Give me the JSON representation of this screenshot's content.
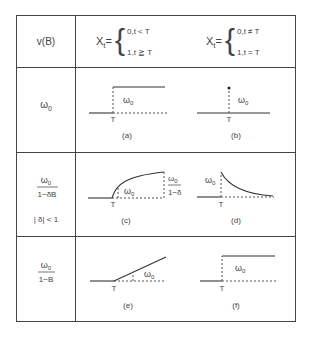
{
  "header": {
    "col0": "v(B)",
    "col1": {
      "lhs": "X",
      "sub": "t",
      "eq": "=",
      "case1": "0,t < T",
      "case2": "1,t ≧ T"
    },
    "col2": {
      "lhs": "X",
      "sub": "t",
      "eq": "=",
      "case1": "0,t ≠ T",
      "case2": "1,t = T"
    }
  },
  "rows": [
    {
      "label": {
        "num": "ω",
        "num_sub": "0"
      },
      "graphs": [
        {
          "id": "a",
          "caption": "(a)",
          "t_label": "T",
          "omega": "ω",
          "omega_sub": "0"
        },
        {
          "id": "b",
          "caption": "(b)",
          "t_label": "T",
          "omega": "ω",
          "omega_sub": "0"
        }
      ]
    },
    {
      "label": {
        "num": "ω",
        "num_sub": "0",
        "den": "1−δB",
        "cond": "| δ| < 1"
      },
      "graphs": [
        {
          "id": "c",
          "caption": "(c)",
          "t_label": "T",
          "omega": "ω",
          "omega_sub": "0",
          "limit_num": "ω",
          "limit_sub": "0",
          "limit_den": "1−δ"
        },
        {
          "id": "d",
          "caption": "(d)",
          "t_label": "T",
          "omega": "ω",
          "omega_sub": "0"
        }
      ]
    },
    {
      "label": {
        "num": "ω",
        "num_sub": "0",
        "den": "1−B"
      },
      "graphs": [
        {
          "id": "e",
          "caption": "(e)",
          "t_label": "T",
          "omega": "ω",
          "omega_sub": "0"
        },
        {
          "id": "f",
          "caption": "(f)",
          "t_label": "T",
          "omega": "ω",
          "omega_sub": "0"
        }
      ]
    }
  ]
}
